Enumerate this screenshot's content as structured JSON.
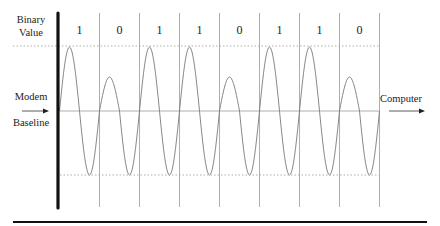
{
  "diagram": {
    "title_label_line1": "Binary",
    "title_label_line2": "Value",
    "left_label_top": "Modem",
    "left_label_bottom": "Baseline",
    "right_label": "Computer",
    "bits": [
      "1",
      "0",
      "1",
      "1",
      "0",
      "1",
      "1",
      "0"
    ],
    "amplitude_fraction": {
      "1": 1.0,
      "0": 0.53
    },
    "trough_fraction": 1.0,
    "colors": {
      "axis": "#111111",
      "grid": "#9a9a9a",
      "wave": "#7a7a7a",
      "dotted": "#9a9a9a",
      "rule": "#111111"
    }
  }
}
